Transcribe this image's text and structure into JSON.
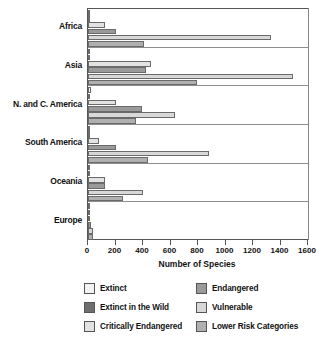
{
  "chart_data": {
    "type": "bar",
    "orientation": "horizontal",
    "title": "",
    "xlabel": "Number of Species",
    "ylabel": "",
    "xlim": [
      0,
      1600
    ],
    "xticks": [
      0,
      200,
      400,
      600,
      800,
      1000,
      1200,
      1400,
      1600
    ],
    "grid": false,
    "legend_position": "bottom",
    "categories": [
      "Africa",
      "Asia",
      "N. and C. America",
      "South America",
      "Oceania",
      "Europe"
    ],
    "series": [
      {
        "name": "Extinct",
        "color": "#f2f2f2",
        "values": [
          8,
          10,
          20,
          5,
          10,
          8
        ]
      },
      {
        "name": "Extinct in the Wild",
        "color": "#6e6e6e",
        "values": [
          2,
          2,
          2,
          1,
          1,
          1
        ]
      },
      {
        "name": "Critically Endangered",
        "color": "#e2e2e2",
        "values": [
          120,
          460,
          200,
          80,
          125,
          15
        ]
      },
      {
        "name": "Endangered",
        "color": "#9a9a9a",
        "values": [
          200,
          420,
          390,
          200,
          125,
          20
        ]
      },
      {
        "name": "Vulnerable",
        "color": "#d8d8d8",
        "values": [
          1330,
          1490,
          630,
          880,
          400,
          38
        ]
      },
      {
        "name": "Lower Risk Categories",
        "color": "#b0b0b0",
        "values": [
          410,
          790,
          350,
          435,
          255,
          38
        ]
      }
    ]
  },
  "legend": {
    "items": [
      {
        "label": "Extinct",
        "color": "#f2f2f2"
      },
      {
        "label": "Extinct in the Wild",
        "color": "#6e6e6e"
      },
      {
        "label": "Critically Endangered",
        "color": "#e2e2e2"
      },
      {
        "label": "Endangered",
        "color": "#9a9a9a"
      },
      {
        "label": "Vulnerable",
        "color": "#d8d8d8"
      },
      {
        "label": "Lower Risk Categories",
        "color": "#b0b0b0"
      }
    ]
  }
}
